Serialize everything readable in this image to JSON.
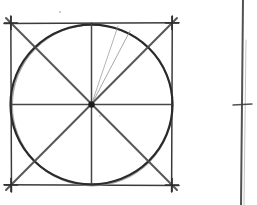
{
  "document": {
    "title": "Hand-drawn geometry sketch",
    "medium": "pencil on white paper",
    "background_color": "#ffffff",
    "graphite_dark": "#2b2b2b",
    "graphite_mid": "#4a4a4a",
    "graphite_light": "#8d8d8d",
    "graphite_faint": "#b0b0b0",
    "canvas": {
      "width": 257,
      "height": 205
    }
  },
  "figures": {
    "main": {
      "label": "square with inscribed circle, diameters and diagonals",
      "square": {
        "label": "bounding-square",
        "left": 11,
        "top": 23,
        "right": 172,
        "bottom": 185,
        "overshoot": 7,
        "stroke_color": "#3a3a3a",
        "stroke_width": 1.5
      },
      "circle": {
        "label": "inscribed-circle",
        "cx": 91.5,
        "cy": 104.5,
        "r": 81,
        "stroke_color": "#2b2b2b",
        "stroke_width": 2.2
      },
      "center_point": {
        "label": "center-dot",
        "cx": 91.5,
        "cy": 104.5,
        "r": 3.2,
        "color": "#1f1f1f"
      },
      "axes": [
        {
          "name": "horizontal-diameter",
          "x1": 11,
          "y1": 104.5,
          "x2": 172,
          "y2": 104.5,
          "stroke_color": "#3d3d3d",
          "stroke_width": 1.5
        },
        {
          "name": "vertical-diameter",
          "x1": 91.5,
          "y1": 23,
          "x2": 91.5,
          "y2": 185,
          "stroke_color": "#3d3d3d",
          "stroke_width": 1.5
        }
      ],
      "diagonals": [
        {
          "name": "diagonal-tl-br",
          "x1": 6,
          "y1": 18,
          "x2": 177,
          "y2": 190,
          "stroke_color": "#4a4a4a",
          "stroke_width": 2.0
        },
        {
          "name": "diagonal-tr-bl",
          "x1": 177,
          "y1": 18,
          "x2": 6,
          "y2": 190,
          "stroke_color": "#4a4a4a",
          "stroke_width": 2.0
        }
      ],
      "extra_rays": [
        {
          "name": "ray-upper-right-steep",
          "x1": 91.5,
          "y1": 104.5,
          "x2": 118,
          "y2": 26,
          "stroke_color": "#9a9a9a",
          "stroke_width": 0.9
        },
        {
          "name": "ray-upper-right-shallow",
          "x1": 91.5,
          "y1": 104.5,
          "x2": 130,
          "y2": 31,
          "stroke_color": "#8d8d8d",
          "stroke_width": 0.9
        }
      ],
      "corner_marks": [
        {
          "name": "corner-mark-top-left",
          "cx": 11,
          "cy": 23
        },
        {
          "name": "corner-mark-top-right",
          "cx": 172,
          "cy": 23
        },
        {
          "name": "corner-mark-bottom-left",
          "cx": 11,
          "cy": 185
        },
        {
          "name": "corner-mark-bottom-right",
          "cx": 172,
          "cy": 185
        }
      ],
      "stray_marks": [
        {
          "name": "stray-dot-top",
          "cx": 60,
          "cy": 12,
          "r": 1.1,
          "color": "#c2c2c2"
        },
        {
          "name": "stray-dot-center-right",
          "cx": 100,
          "cy": 116,
          "r": 0.9,
          "color": "#c8c8c8"
        }
      ]
    },
    "secondary": {
      "label": "partial second sketch at right edge",
      "vertical_line": {
        "name": "partial-vertical-line",
        "x1": 243,
        "y1": 0,
        "x2": 241,
        "y2": 205,
        "stroke_color": "#4a4a4a",
        "stroke_width": 2.0
      },
      "tick": {
        "name": "partial-tick-mark",
        "x1": 233,
        "y1": 105,
        "x2": 252,
        "y2": 104,
        "stroke_color": "#3d3d3d",
        "stroke_width": 1.4
      },
      "faint_vertical": {
        "name": "partial-faint-vertical",
        "x1": 246,
        "y1": 40,
        "x2": 244,
        "y2": 205,
        "stroke_color": "#b5b5b5",
        "stroke_width": 1.0
      }
    }
  }
}
